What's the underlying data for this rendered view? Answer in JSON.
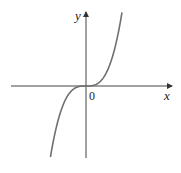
{
  "chart_data": {
    "type": "line",
    "title": "",
    "xlabel": "x",
    "ylabel": "y",
    "origin_label": "0",
    "function": "y = x^3",
    "series": [
      {
        "name": "y = x^3",
        "x": [
          -1.6,
          -1.2,
          -0.8,
          -0.4,
          0,
          0.4,
          0.8,
          1.2,
          1.6
        ],
        "values": [
          -4.1,
          -1.73,
          -0.51,
          -0.06,
          0,
          0.06,
          0.51,
          1.73,
          4.1
        ]
      }
    ],
    "grid": false,
    "legend": "none",
    "ticks": false,
    "color": "#707070"
  }
}
